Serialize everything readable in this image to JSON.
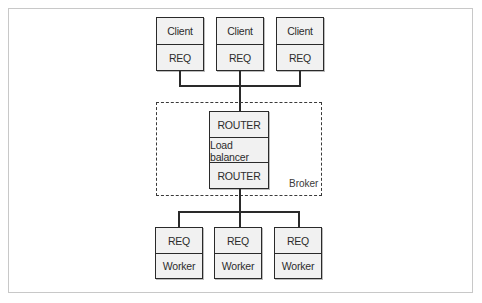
{
  "diagram": {
    "title": "",
    "clients": [
      {
        "top": "Client",
        "bottom": "REQ"
      },
      {
        "top": "Client",
        "bottom": "REQ"
      },
      {
        "top": "Client",
        "bottom": "REQ"
      }
    ],
    "broker": {
      "label": "Broker",
      "stack": [
        "ROUTER",
        "Load balancer",
        "ROUTER"
      ]
    },
    "workers": [
      {
        "top": "REQ",
        "bottom": "Worker"
      },
      {
        "top": "REQ",
        "bottom": "Worker"
      },
      {
        "top": "REQ",
        "bottom": "Worker"
      }
    ]
  }
}
